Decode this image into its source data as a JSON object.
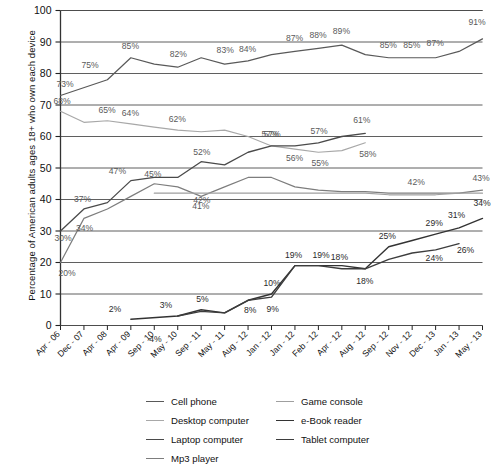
{
  "chart_data": {
    "type": "line",
    "title": "",
    "xlabel": "",
    "ylabel": "Percentage of American adults ages 18+ who own each device",
    "ylim": [
      0,
      100
    ],
    "ytick_labels": [
      "0",
      "10",
      "20",
      "30",
      "40",
      "50",
      "60",
      "70",
      "80",
      "90",
      "100"
    ],
    "grid": true,
    "legend_position": "bottom",
    "categories": [
      "Apr - 06",
      "Dec - 07",
      "Apr - 08",
      "Apr - 09",
      "Sep - 10",
      "May - 10",
      "Sep - 11",
      "May - 11",
      "Aug - 12",
      "Jan - 12",
      "Jan - 12",
      "Feb - 12",
      "Apr - 12",
      "Aug - 12",
      "Sep - 12",
      "Nov - 12",
      "Dec - 13",
      "Jan - 13",
      "May - 13"
    ],
    "series": [
      {
        "name": "Cell phone",
        "color": "#595959",
        "width": 1.2,
        "x": [
          0,
          2,
          3,
          4,
          5,
          6,
          7,
          8,
          9,
          10,
          11,
          12,
          13,
          14,
          15,
          16,
          17,
          18
        ],
        "values": [
          73,
          78,
          85,
          83,
          82,
          85,
          83,
          84,
          86,
          87,
          88,
          89,
          86,
          85,
          85,
          85,
          87,
          91
        ],
        "labels": [
          {
            "i": 0,
            "v": "73%",
            "dx": -4,
            "dy": -9
          },
          {
            "i": 2,
            "v": "75%",
            "dx": -26,
            "dy": -12
          },
          {
            "i": 3,
            "v": "85%",
            "dx": -9,
            "dy": -9
          },
          {
            "i": 5,
            "v": "82%",
            "dx": -8,
            "dy": -10
          },
          {
            "i": 7,
            "v": "83%",
            "dx": -8,
            "dy": -11
          },
          {
            "i": 8,
            "v": "84%",
            "dx": -9,
            "dy": -9
          },
          {
            "i": 10,
            "v": "87%",
            "dx": -9,
            "dy": -10
          },
          {
            "i": 11,
            "v": "88%",
            "dx": -9,
            "dy": -10
          },
          {
            "i": 12,
            "v": "89%",
            "dx": -9,
            "dy": -11
          },
          {
            "i": 14,
            "v": "85%",
            "dx": -9,
            "dy": -10
          },
          {
            "i": 15,
            "v": "85%",
            "dx": -9,
            "dy": -10
          },
          {
            "i": 16,
            "v": "87%",
            "dx": -9,
            "dy": -12
          },
          {
            "i": 18,
            "v": "91%",
            "dx": -14,
            "dy": -14
          }
        ]
      },
      {
        "name": "Desktop computer",
        "color": "#a8a8a8",
        "width": 1.2,
        "x": [
          0,
          1,
          2,
          3,
          4,
          5,
          6,
          7,
          8,
          9,
          10,
          11,
          12,
          13
        ],
        "values": [
          68,
          64.5,
          65,
          64,
          63,
          62,
          61.5,
          62,
          60,
          57,
          56,
          55,
          55.5,
          58
        ],
        "labels": [
          {
            "i": 0,
            "v": "68%",
            "dx": -7,
            "dy": -7
          },
          {
            "i": 2,
            "v": "65%",
            "dx": -9,
            "dy": -8
          },
          {
            "i": 3,
            "v": "64%",
            "dx": -9,
            "dy": -8
          },
          {
            "i": 5,
            "v": "62%",
            "dx": -9,
            "dy": -8
          },
          {
            "i": 9,
            "v": "57%",
            "dx": -10,
            "dy": -9
          },
          {
            "i": 10,
            "v": "56%",
            "dx": -9,
            "dy": 12
          },
          {
            "i": 11,
            "v": "55%",
            "dx": -7,
            "dy": 14
          },
          {
            "i": 13,
            "v": "58%",
            "dx": -6,
            "dy": 14
          }
        ]
      },
      {
        "name": "Laptop computer",
        "color": "#4a4a4a",
        "width": 1.3,
        "x": [
          0,
          1,
          2,
          3,
          4,
          5,
          6,
          7,
          8,
          9,
          10,
          11,
          12,
          13
        ],
        "values": [
          30,
          37,
          39,
          46,
          47,
          47,
          52,
          51,
          55,
          57,
          57,
          58,
          60,
          61
        ],
        "labels": [
          {
            "i": 0,
            "v": "30%",
            "dx": -6,
            "dy": 10
          },
          {
            "i": 1,
            "v": "37%",
            "dx": -10,
            "dy": -7
          },
          {
            "i": 3,
            "v": "47%",
            "dx": -22,
            "dy": -7
          },
          {
            "i": 6,
            "v": "52%",
            "dx": -8,
            "dy": -7
          },
          {
            "i": 9,
            "v": "57%",
            "dx": -8,
            "dy": -9
          },
          {
            "i": 11,
            "v": "57%",
            "dx": -8,
            "dy": -9
          },
          {
            "i": 13,
            "v": "61%",
            "dx": -12,
            "dy": -10
          }
        ]
      },
      {
        "name": "Mp3 player",
        "color": "#7d7d7d",
        "width": 1.2,
        "x": [
          0,
          1,
          2,
          3,
          4,
          5,
          6,
          7,
          8,
          9,
          10,
          11,
          12,
          13,
          14,
          15,
          16,
          17,
          18
        ],
        "values": [
          20,
          34,
          37,
          41,
          45,
          44,
          41,
          44,
          47,
          47,
          44,
          43,
          42.5,
          42.5,
          42,
          42,
          42,
          42,
          43
        ],
        "labels": [
          {
            "i": 0,
            "v": "20%",
            "dx": -2,
            "dy": 13
          },
          {
            "i": 1,
            "v": "34%",
            "dx": -8,
            "dy": 13
          },
          {
            "i": 4,
            "v": "45%",
            "dx": -10,
            "dy": -7
          },
          {
            "i": 6,
            "v": "41%",
            "dx": -9,
            "dy": 13
          },
          {
            "i": 16,
            "v": "42%",
            "dx": -28,
            "dy": -8
          },
          {
            "i": 18,
            "v": "43%",
            "dx": -10,
            "dy": -9
          }
        ]
      },
      {
        "name": "Game console",
        "color": "#9f9f9f",
        "width": 1.2,
        "x": [
          4,
          5,
          6,
          7,
          8,
          9,
          10,
          11,
          12,
          13,
          14,
          15,
          16,
          17,
          18
        ],
        "values": [
          42,
          42,
          42,
          42,
          42,
          42,
          42,
          42,
          42,
          42,
          41.5,
          41.5,
          41.5,
          42,
          42
        ],
        "labels": [
          {
            "i": 6,
            "v": "42%",
            "dx": -8,
            "dy": 10
          }
        ]
      },
      {
        "name": "e-Book reader",
        "color": "#333333",
        "width": 1.4,
        "x": [
          3,
          5,
          6,
          7,
          8,
          9,
          10,
          11,
          12,
          13,
          14,
          15,
          16,
          17,
          18
        ],
        "values": [
          2,
          3,
          5,
          4,
          8,
          10,
          19,
          19,
          19,
          18,
          25,
          27,
          29,
          31,
          34
        ],
        "labels": [
          {
            "i": 3,
            "v": "2%",
            "dx": -22,
            "dy": -7
          },
          {
            "i": 5,
            "v": "3%",
            "dx": -18,
            "dy": -8
          },
          {
            "i": 6,
            "v": "5%",
            "dx": -5,
            "dy": -8
          },
          {
            "i": 8,
            "v": "8%",
            "dx": -4,
            "dy": 13
          },
          {
            "i": 9,
            "v": "10%",
            "dx": -8,
            "dy": -8
          },
          {
            "i": 10,
            "v": "19%",
            "dx": -10,
            "dy": -8
          },
          {
            "i": 11,
            "v": "19%",
            "dx": -6,
            "dy": -8
          },
          {
            "i": 14,
            "v": "25%",
            "dx": -10,
            "dy": -8
          },
          {
            "i": 16,
            "v": "29%",
            "dx": -10,
            "dy": -8
          },
          {
            "i": 17,
            "v": "31%",
            "dx": -11,
            "dy": -10
          },
          {
            "i": 18,
            "v": "34%",
            "dx": -9,
            "dy": -12
          }
        ]
      },
      {
        "name": "Tablet computer",
        "color": "#3d3d3d",
        "width": 1.4,
        "x": [
          5,
          6,
          7,
          8,
          9,
          10,
          11,
          12,
          13,
          14,
          15,
          16,
          17
        ],
        "values": [
          3,
          4.5,
          4,
          8,
          9,
          19,
          19,
          18,
          18,
          21,
          23,
          24,
          26
        ],
        "labels": [
          {
            "i": 4,
            "v": "4%",
            "dx": -5,
            "dy": 16
          },
          {
            "i": 9,
            "v": "9%",
            "dx": -5,
            "dy": 15
          },
          {
            "i": 12,
            "v": "18%",
            "dx": -11,
            "dy": -9
          },
          {
            "i": 13,
            "v": "18%",
            "dx": -9,
            "dy": 15
          },
          {
            "i": 16,
            "v": "24%",
            "dx": -10,
            "dy": 11
          },
          {
            "i": 17,
            "v": "26%",
            "dx": -2,
            "dy": 9
          }
        ]
      }
    ],
    "legend": [
      {
        "label": "Cell phone",
        "color": "#595959"
      },
      {
        "label": "Desktop computer",
        "color": "#a8a8a8"
      },
      {
        "label": "Laptop computer",
        "color": "#4a4a4a"
      },
      {
        "label": "Mp3 player",
        "color": "#7d7d7d"
      },
      {
        "label": "Game console",
        "color": "#9f9f9f"
      },
      {
        "label": "e-Book reader",
        "color": "#333333"
      },
      {
        "label": "Tablet computer",
        "color": "#3d3d3d"
      }
    ]
  }
}
